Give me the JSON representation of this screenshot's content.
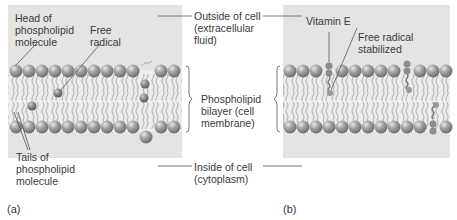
{
  "figure": {
    "panel_a": {
      "caption": "(a)",
      "labels": {
        "head": [
          "Head of",
          "phospholipid",
          "molecule"
        ],
        "free_radical": [
          "Free",
          "radical"
        ],
        "tails": [
          "Tails of",
          "phospholipid",
          "molecule"
        ]
      }
    },
    "panel_b": {
      "caption": "(b)",
      "labels": {
        "vitamin_e": [
          "Vitamin E"
        ],
        "free_radical_stabilized": [
          "Free radical",
          "stabilized"
        ]
      }
    },
    "center_labels": {
      "outside": [
        "Outside of cell",
        "(extracellular",
        "fluid)"
      ],
      "bilayer": [
        "Phospholipid",
        "bilayer (cell",
        "membrane)"
      ],
      "inside": [
        "Inside of cell",
        "(cytoplasm)"
      ]
    },
    "colors": {
      "background_panel": "#e4e4e4",
      "head_sphere": "#9a9a9a",
      "tail": "#b5b5b5",
      "leader_line": "#555555",
      "vitamin_e": "#8c8c8c"
    }
  }
}
